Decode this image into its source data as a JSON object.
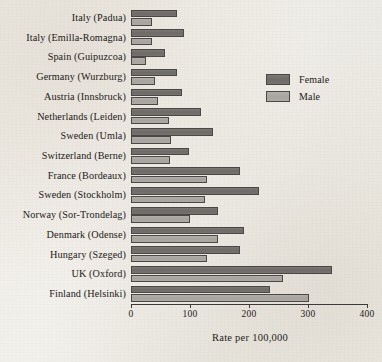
{
  "chart_data": {
    "type": "bar",
    "orientation": "horizontal",
    "title": "",
    "xlabel": "Rate per 100,000",
    "ylabel": "",
    "xlim": [
      0,
      400
    ],
    "xticks": [
      0,
      100,
      200,
      300,
      400
    ],
    "xtick_labels": [
      "0",
      "100",
      "200",
      "300",
      "400"
    ],
    "grid": false,
    "legend_position": "upper right",
    "categories": [
      "Italy (Padua)",
      "Italy (Emilla-Romagna)",
      "Spain (Guipuzcoa)",
      "Germany (Wurzburg)",
      "Austria (Innsbruck)",
      "Netherlands (Leiden)",
      "Sweden (Umla)",
      "Switzerland (Berne)",
      "France (Bordeaux)",
      "Sweden (Stockholm)",
      "Norway (Sor-Trondelag)",
      "Denmark (Odense)",
      "Hungary (Szeged)",
      "UK (Oxford)",
      "Finland (Helsinki)"
    ],
    "series": [
      {
        "name": "Female",
        "color": "#6d6a67",
        "values": [
          78,
          90,
          58,
          78,
          86,
          119,
          139,
          98,
          185,
          217,
          148,
          192,
          185,
          341,
          236
        ]
      },
      {
        "name": "Male",
        "color": "#a8a5a1",
        "values": [
          36,
          36,
          26,
          41,
          46,
          64,
          68,
          66,
          129,
          126,
          100,
          148,
          129,
          258,
          302
        ]
      }
    ]
  },
  "legend": {
    "items": [
      {
        "label": "Female",
        "color": "#6d6a67"
      },
      {
        "label": "Male",
        "color": "#a8a5a1"
      }
    ]
  }
}
